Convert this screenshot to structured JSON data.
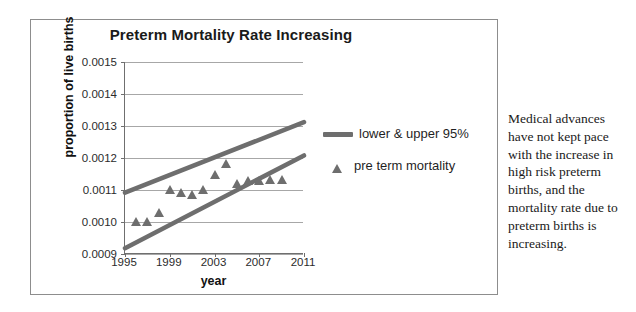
{
  "chart_data": {
    "type": "line",
    "title": "Preterm Mortality Rate Increasing",
    "xlabel": "year",
    "ylabel": "proportion of live births",
    "xlim": [
      1995,
      2011
    ],
    "ylim": [
      0.0009,
      0.0015
    ],
    "grid": true,
    "legend_position": "right",
    "xticks": [
      "1995",
      "1999",
      "2003",
      "2007",
      "2011"
    ],
    "xtick_values": [
      1995,
      1999,
      2003,
      2007,
      2011
    ],
    "yticks": [
      "0.0015",
      "0.0014",
      "0.0013",
      "0.0012",
      "0.0011",
      "0.0010",
      "0.0009"
    ],
    "ytick_values": [
      0.0015,
      0.0014,
      0.0013,
      0.0012,
      0.0011,
      0.001,
      0.0009
    ],
    "series": [
      {
        "name": "upper 95%",
        "type": "line",
        "x": [
          1995,
          2011
        ],
        "values": [
          0.001092,
          0.001312
        ]
      },
      {
        "name": "lower 95%",
        "type": "line",
        "x": [
          1995,
          2011
        ],
        "values": [
          0.000918,
          0.001208
        ]
      },
      {
        "name": "pre term mortality",
        "type": "scatter",
        "x": [
          1996,
          1997,
          1998,
          1999,
          2000,
          2001,
          2002,
          2003,
          2004,
          2005,
          2006,
          2007,
          2008,
          2009
        ],
        "values": [
          0.001,
          0.001001,
          0.001028,
          0.0011,
          0.00109,
          0.001085,
          0.0011,
          0.001148,
          0.001182,
          0.00112,
          0.001128,
          0.001129,
          0.00113,
          0.001131
        ]
      }
    ],
    "legend": [
      {
        "label": "lower & upper 95%",
        "marker": "line"
      },
      {
        "label": "pre term mortality",
        "marker": "triangle"
      }
    ],
    "colors": {
      "band_line": "#6e6e6e",
      "marker": "#6e6e6e",
      "gridline": "#a7a7a7",
      "axis": "#6f6f6f",
      "text": "#1a1a1a",
      "frame": "#8d8d8d"
    }
  },
  "side_note": {
    "text": "Medical advances have not kept pace with the increase in high risk preterm births, and the mortality rate due to preterm births is increasing."
  }
}
